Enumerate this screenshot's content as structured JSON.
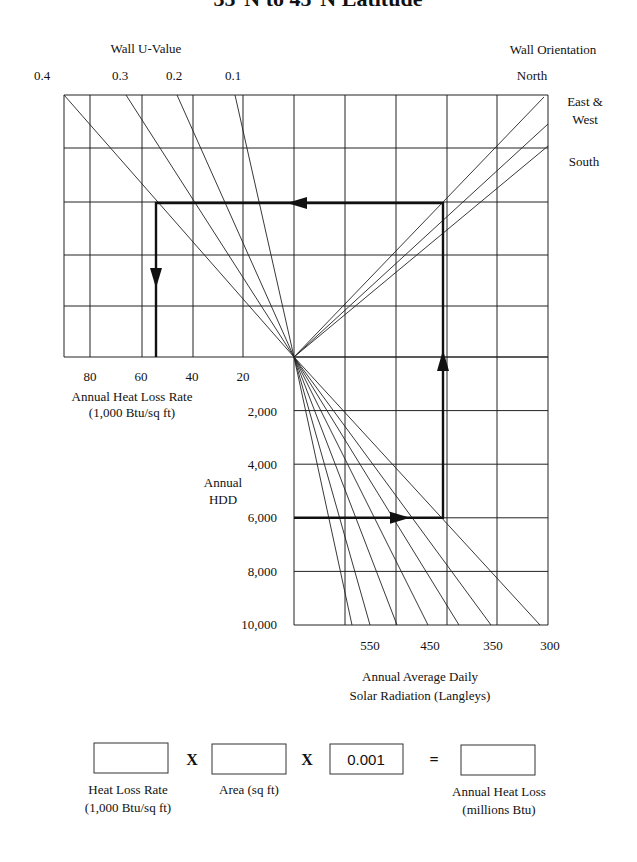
{
  "chart_data": {
    "type": "nomograph",
    "title": "35°N to 45°N Latitude",
    "upper_left": {
      "axis_label_top": "Wall U-Value",
      "u_values": [
        "0.4",
        "0.3",
        "0.2",
        "0.1"
      ],
      "xlabel": "Annual Heat Loss Rate",
      "xlabel_units": "(1,000 Btu/sq ft)",
      "x_ticks": [
        "80",
        "60",
        "40",
        "20"
      ],
      "x_tick_values": [
        80,
        60,
        40,
        20
      ],
      "x_range": [
        100,
        0
      ]
    },
    "upper_right": {
      "legend_title": "Wall Orientation",
      "orientations": [
        "North",
        "East &",
        "West",
        "South"
      ],
      "orientation_names": [
        "North",
        "East & West",
        "South"
      ]
    },
    "lower": {
      "ylabel": "Annual",
      "ylabel2": "HDD",
      "y_ticks": [
        "2,000",
        "4,000",
        "6,000",
        "8,000",
        "10,000"
      ],
      "y_tick_values": [
        2000,
        4000,
        6000,
        8000,
        10000
      ],
      "y_range": [
        0,
        10000
      ],
      "xlabel": "Annual Average Daily",
      "xlabel2": "Solar Radiation (Langleys)",
      "x_ticks": [
        "550",
        "450",
        "350",
        "300"
      ],
      "radiation_lines_langleys": [
        600,
        550,
        500,
        450,
        400,
        350,
        300
      ]
    },
    "example_path": {
      "hdd": 6000,
      "orientation": "East & West",
      "heat_loss_rate": 54,
      "steps": [
        "6,000 HDD → radiation line",
        "up to wall orientation line",
        "left to wall U-value line",
        "down to heat loss rate"
      ]
    }
  },
  "equation": {
    "box1_value": "",
    "box1_label_1": "Heat Loss Rate",
    "box1_label_2": "(1,000 Btu/sq ft)",
    "op1": "X",
    "box2_value": "",
    "box2_label": "Area (sq ft)",
    "op2": "X",
    "box3_value": "0.001",
    "op3": "=",
    "box4_value": "",
    "box4_label_1": "Annual Heat Loss",
    "box4_label_2": "(millions Btu)"
  }
}
